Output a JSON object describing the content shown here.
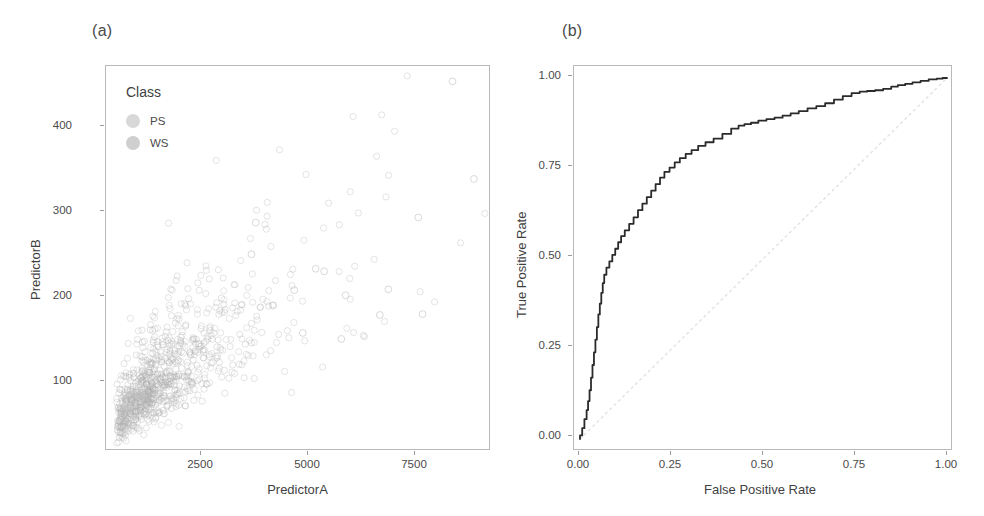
{
  "figure": {
    "panels": [
      {
        "tag": "(a)",
        "type": "scatter"
      },
      {
        "tag": "(b)",
        "type": "line"
      }
    ]
  },
  "panel_a": {
    "tag": "(a)",
    "xlabel": "PredictorA",
    "ylabel": "PredictorB",
    "xticks": [
      "2500",
      "5000",
      "7500"
    ],
    "yticks": [
      "100",
      "200",
      "300",
      "400"
    ],
    "legend": {
      "title": "Class",
      "items": [
        {
          "label": "PS",
          "color": "#d8d8d8"
        },
        {
          "label": "WS",
          "color": "#cfcfcf"
        }
      ]
    }
  },
  "panel_b": {
    "tag": "(b)",
    "xlabel": "False Positive Rate",
    "ylabel": "True Positive Rate",
    "xticks": [
      "0.00",
      "0.25",
      "0.50",
      "0.75",
      "1.00"
    ],
    "yticks": [
      "0.00",
      "0.25",
      "0.50",
      "0.75",
      "1.00"
    ]
  },
  "colors": {
    "curve": "#2b2b2b",
    "reference_line": "#e2e2e2",
    "frame": "#b9b9b9",
    "text": "#3f3f3f",
    "point_ps": "#b9b9b9",
    "point_ws": "#9d9d9d"
  },
  "chart_data": [
    {
      "type": "scatter",
      "title": "(a)",
      "xlabel": "PredictorA",
      "ylabel": "PredictorB",
      "xlim": [
        0,
        9000
      ],
      "ylim": [
        30,
        480
      ],
      "xticks": [
        2500,
        5000,
        7500
      ],
      "yticks": [
        100,
        200,
        300,
        400
      ],
      "grid": false,
      "legend": {
        "title": "Class",
        "entries": [
          "PS",
          "WS"
        ],
        "position": "inside-top-left"
      },
      "series": [
        {
          "name": "PS",
          "n_points": 720,
          "description": "Dense positively-correlated cloud concentrated at low PredictorA (300-2500) and low PredictorB (40-160), fanning upward-right",
          "cluster": {
            "x_mean": 1250,
            "y_mean": 95,
            "x_sd": 700,
            "y_sd": 38,
            "correlation": 0.82
          }
        },
        {
          "name": "WS",
          "n_points": 280,
          "description": "Sparser points overlapping the PS cloud, plus scattered outliers out to PredictorA 8500 and PredictorB 460",
          "cluster": {
            "x_mean": 2300,
            "y_mean": 150,
            "x_sd": 1500,
            "y_sd": 70,
            "correlation": 0.7
          }
        }
      ],
      "notable_outliers": [
        [
          8100,
          462
        ],
        [
          8600,
          348
        ],
        [
          7300,
          303
        ],
        [
          6600,
          219
        ],
        [
          5600,
          212
        ],
        [
          7400,
          190
        ],
        [
          6400,
          189
        ],
        [
          4900,
          243
        ],
        [
          5100,
          240
        ],
        [
          4400,
          218
        ],
        [
          3500,
          297
        ],
        [
          3400,
          260
        ],
        [
          3900,
          200
        ],
        [
          4600,
          168
        ],
        [
          5500,
          161
        ]
      ]
    },
    {
      "type": "line",
      "title": "(b)",
      "xlabel": "False Positive Rate",
      "ylabel": "True Positive Rate",
      "xlim": [
        0,
        1
      ],
      "ylim": [
        0,
        1
      ],
      "xticks": [
        0.0,
        0.25,
        0.5,
        0.75,
        1.0
      ],
      "yticks": [
        0.0,
        0.25,
        0.5,
        0.75,
        1.0
      ],
      "grid": false,
      "legend": null,
      "series": [
        {
          "name": "ROC curve",
          "style": "solid",
          "color": "#2b2b2b",
          "points": [
            [
              0.0,
              0.0
            ],
            [
              0.006,
              0.01
            ],
            [
              0.012,
              0.03
            ],
            [
              0.018,
              0.055
            ],
            [
              0.022,
              0.08
            ],
            [
              0.026,
              0.105
            ],
            [
              0.03,
              0.135
            ],
            [
              0.034,
              0.17
            ],
            [
              0.038,
              0.205
            ],
            [
              0.042,
              0.24
            ],
            [
              0.046,
              0.275
            ],
            [
              0.05,
              0.31
            ],
            [
              0.054,
              0.345
            ],
            [
              0.058,
              0.375
            ],
            [
              0.062,
              0.405
            ],
            [
              0.066,
              0.432
            ],
            [
              0.072,
              0.455
            ],
            [
              0.08,
              0.475
            ],
            [
              0.088,
              0.492
            ],
            [
              0.096,
              0.51
            ],
            [
              0.104,
              0.527
            ],
            [
              0.112,
              0.545
            ],
            [
              0.122,
              0.562
            ],
            [
              0.134,
              0.578
            ],
            [
              0.146,
              0.596
            ],
            [
              0.158,
              0.614
            ],
            [
              0.17,
              0.634
            ],
            [
              0.182,
              0.652
            ],
            [
              0.194,
              0.67
            ],
            [
              0.206,
              0.688
            ],
            [
              0.218,
              0.706
            ],
            [
              0.23,
              0.724
            ],
            [
              0.244,
              0.74
            ],
            [
              0.258,
              0.752
            ],
            [
              0.272,
              0.766
            ],
            [
              0.288,
              0.778
            ],
            [
              0.304,
              0.79
            ],
            [
              0.322,
              0.8
            ],
            [
              0.342,
              0.812
            ],
            [
              0.364,
              0.822
            ],
            [
              0.388,
              0.832
            ],
            [
              0.412,
              0.845
            ],
            [
              0.432,
              0.86
            ],
            [
              0.448,
              0.868
            ],
            [
              0.466,
              0.872
            ],
            [
              0.486,
              0.876
            ],
            [
              0.508,
              0.882
            ],
            [
              0.53,
              0.886
            ],
            [
              0.552,
              0.89
            ],
            [
              0.574,
              0.896
            ],
            [
              0.596,
              0.902
            ],
            [
              0.62,
              0.908
            ],
            [
              0.644,
              0.916
            ],
            [
              0.668,
              0.922
            ],
            [
              0.692,
              0.93
            ],
            [
              0.716,
              0.94
            ],
            [
              0.74,
              0.95
            ],
            [
              0.762,
              0.958
            ],
            [
              0.782,
              0.962
            ],
            [
              0.804,
              0.964
            ],
            [
              0.826,
              0.966
            ],
            [
              0.848,
              0.97
            ],
            [
              0.866,
              0.976
            ],
            [
              0.886,
              0.98
            ],
            [
              0.906,
              0.984
            ],
            [
              0.928,
              0.988
            ],
            [
              0.95,
              0.992
            ],
            [
              0.972,
              0.996
            ],
            [
              0.988,
              0.998
            ],
            [
              1.0,
              1.0
            ]
          ]
        },
        {
          "name": "chance reference",
          "style": "dotted",
          "color": "#e2e2e2",
          "points": [
            [
              0.0,
              0.0
            ],
            [
              1.0,
              1.0
            ]
          ]
        }
      ]
    }
  ]
}
